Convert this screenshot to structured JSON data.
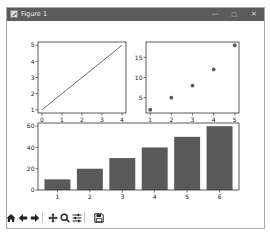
{
  "window": {
    "title": "Figure 1",
    "controls": {
      "minimize": "—",
      "maximize": "☐",
      "close": "✕"
    }
  },
  "toolbar": {
    "buttons": [
      {
        "name": "home",
        "icon": "home-icon"
      },
      {
        "name": "back",
        "icon": "arrow-left-icon"
      },
      {
        "name": "forward",
        "icon": "arrow-right-icon"
      },
      {
        "name": "pan",
        "icon": "move-icon"
      },
      {
        "name": "zoom",
        "icon": "magnifier-icon"
      },
      {
        "name": "configure-subplots",
        "icon": "sliders-icon"
      },
      {
        "name": "save",
        "icon": "floppy-disk-icon"
      }
    ]
  },
  "colors": {
    "titlebar": "#5c5c5c",
    "plot_ink": "#5a5a5a",
    "axes": "#333333",
    "background": "#ffffff"
  },
  "chart_data": [
    {
      "type": "line",
      "position": "top-left",
      "title": "",
      "x": [
        0,
        1,
        2,
        3,
        4
      ],
      "series": [
        {
          "name": "line",
          "values": [
            1,
            2,
            3,
            4,
            5
          ]
        }
      ],
      "xticks": [
        "0",
        "1",
        "2",
        "3",
        "4"
      ],
      "yticks": [
        "1",
        "2",
        "3",
        "4",
        "5"
      ],
      "xlim": [
        -0.2,
        4.2
      ],
      "ylim": [
        0.8,
        5.2
      ],
      "xlabel": "",
      "ylabel": "",
      "grid": false
    },
    {
      "type": "scatter",
      "position": "top-right",
      "title": "",
      "x": [
        1,
        2,
        3,
        4,
        5
      ],
      "series": [
        {
          "name": "points",
          "values": [
            2,
            5,
            8,
            12,
            18
          ]
        }
      ],
      "xticks": [
        "1",
        "2",
        "3",
        "4",
        "5"
      ],
      "yticks": [
        "5",
        "10",
        "15"
      ],
      "xlim": [
        0.8,
        5.2
      ],
      "ylim": [
        1.2,
        18.8
      ],
      "xlabel": "",
      "ylabel": "",
      "grid": false
    },
    {
      "type": "bar",
      "position": "bottom",
      "title": "",
      "categories": [
        "1",
        "2",
        "3",
        "4",
        "5",
        "6"
      ],
      "values": [
        10,
        20,
        30,
        40,
        50,
        60
      ],
      "yticks": [
        "0",
        "20",
        "40",
        "60"
      ],
      "ylim": [
        0,
        63
      ],
      "xlabel": "",
      "ylabel": "",
      "grid": false
    }
  ]
}
